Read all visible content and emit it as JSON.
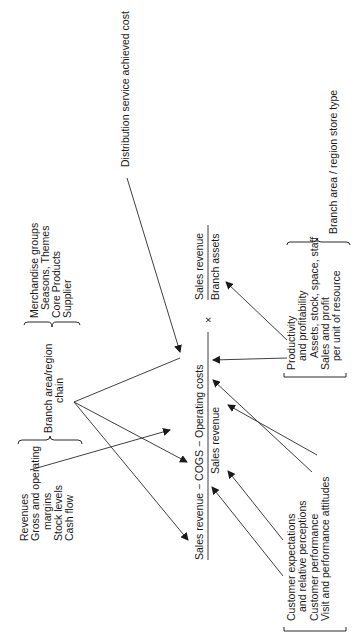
{
  "orientation": "rotated -90 degrees (text reads bottom to top)",
  "formula": {
    "main_numerator": "Sales revenue − COGS − Operating costs",
    "main_denominator": "Sales revenue",
    "multiply_sign": "×",
    "second_numerator": "Sales revenue",
    "second_denominator": "Branch assets"
  },
  "labels": {
    "distribution": "Distribution service achieved cost",
    "branch_store_type": "Branch area / region store type",
    "branch_chain_line1": "Branch area/region",
    "branch_chain_line2": "chain"
  },
  "groups": {
    "merchandise": [
      "Merchandise groups",
      "Seasons, Themes",
      "Core Products",
      "Supplier"
    ],
    "financial": [
      "Revenues",
      "Gross and operating",
      "margins",
      "Stock levels",
      "Cash flow"
    ],
    "customer": [
      "Customer expectations",
      "and relative perceptions",
      "Customer performance",
      "Visit and performance attitudes"
    ],
    "productivity": [
      "Productivity",
      "and profitability",
      "Assets, stock, space, staff",
      "Sales and profit",
      "per unit of resource"
    ]
  }
}
